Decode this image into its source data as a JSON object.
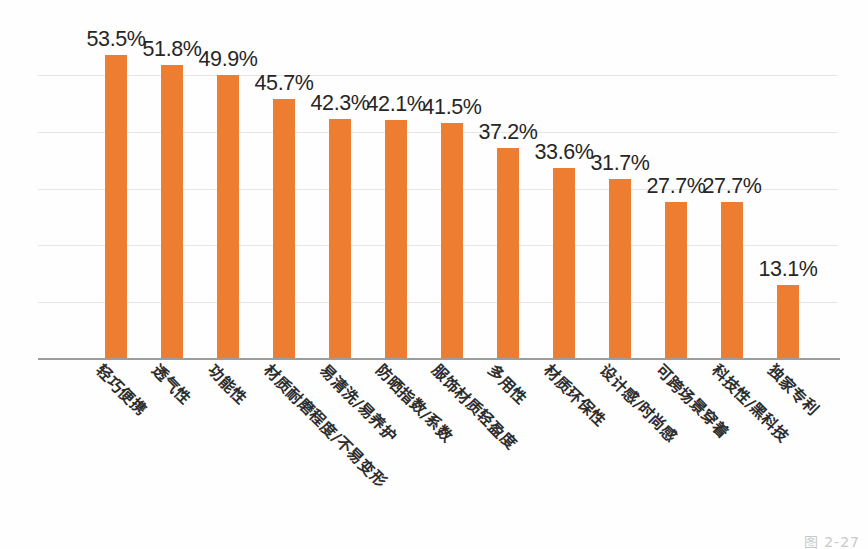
{
  "chart_data": {
    "type": "bar",
    "title": "",
    "subtitle": "",
    "xlabel": "",
    "ylabel": "",
    "ylim": [
      0,
      60
    ],
    "grid": true,
    "gridlines": [
      10,
      20,
      30,
      40,
      50
    ],
    "legend": "none",
    "orientation": "vertical",
    "value_suffix": "%",
    "bar_color": "#ED7D31",
    "categories": [
      "轻巧便携",
      "透气性",
      "功能性",
      "材质耐磨程度/不易变形",
      "易清洗/易养护",
      "防晒指数/系数",
      "服饰材质轻盈度",
      "多用性",
      "材质环保性",
      "设计感/时尚感",
      "可跨场景穿着",
      "科技性/黑科技",
      "独家专利"
    ],
    "values": [
      53.5,
      51.8,
      49.9,
      45.7,
      42.3,
      42.1,
      41.5,
      37.2,
      33.6,
      31.7,
      27.7,
      27.7,
      13.1
    ],
    "value_labels": [
      "53.5%",
      "51.8%",
      "49.9%",
      "45.7%",
      "42.3%",
      "42.1%",
      "41.5%",
      "37.2%",
      "33.6%",
      "31.7%",
      "27.7%",
      "27.7%",
      "13.1%"
    ]
  },
  "caption": {
    "text": "图 2-27"
  },
  "colors": {
    "bar": "#ED7D31",
    "axis": "#9D9D9D",
    "grid": "#E9E4E4",
    "label_text": "#262626",
    "background": "#FEFEFE"
  }
}
